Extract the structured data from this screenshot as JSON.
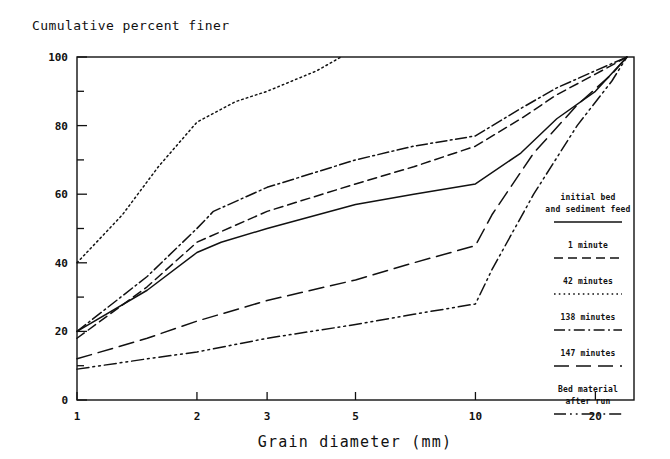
{
  "chart_data": {
    "type": "line",
    "title": "Cumulative percent finer",
    "xlabel": "Grain diameter (mm)",
    "ylabel": "Cumulative percent finer",
    "xscale": "log",
    "xlim": [
      1,
      25
    ],
    "ylim": [
      0,
      100
    ],
    "grid": false,
    "legend_position": "inside-right",
    "xticks": [
      "1",
      "2",
      "3",
      "5",
      "10",
      "20"
    ],
    "xtick_values": [
      1,
      2,
      3,
      5,
      10,
      20
    ],
    "yticks": [
      "0",
      "20",
      "40",
      "60",
      "80",
      "100"
    ],
    "ytick_values": [
      0,
      20,
      40,
      60,
      80,
      100
    ],
    "yminor_ticks": [
      10,
      30,
      50,
      70,
      90
    ],
    "series": [
      {
        "name": "Initial bed and sediment feed",
        "dash": "solid",
        "x": [
          1,
          1.5,
          2,
          2.3,
          3,
          5,
          7,
          10,
          13,
          16,
          20,
          24
        ],
        "values": [
          20,
          32,
          43,
          46,
          50,
          57,
          60,
          63,
          72,
          82,
          90,
          100
        ]
      },
      {
        "name": "1 minute",
        "dash": "dashed",
        "x": [
          1,
          1.5,
          2,
          3,
          5,
          7,
          10,
          13,
          16,
          20,
          24
        ],
        "values": [
          18,
          33,
          46,
          55,
          63,
          68,
          74,
          82,
          89,
          95,
          100
        ]
      },
      {
        "name": "42 minutes",
        "dash": "dotted",
        "x": [
          1,
          1.3,
          1.6,
          2,
          2.5,
          3,
          4,
          4.6
        ],
        "values": [
          40,
          54,
          68,
          81,
          87,
          90,
          96,
          100
        ]
      },
      {
        "name": "138 minutes",
        "dash": "dash-dot",
        "x": [
          1,
          1.5,
          2,
          2.2,
          3,
          5,
          7,
          10,
          13,
          16,
          20,
          24
        ],
        "values": [
          20,
          36,
          50,
          55,
          62,
          70,
          74,
          77,
          85,
          91,
          96,
          100
        ]
      },
      {
        "name": "147 minutes",
        "dash": "long-dash",
        "x": [
          1,
          1.5,
          2,
          3,
          5,
          7,
          10,
          11,
          14,
          18,
          22,
          24
        ],
        "values": [
          12,
          18,
          23,
          29,
          35,
          40,
          45,
          54,
          72,
          86,
          95,
          100
        ]
      },
      {
        "name": "Bed material after run",
        "dash": "dash-dot-dot",
        "x": [
          1,
          1.5,
          2,
          3,
          5,
          7,
          10,
          11,
          14,
          18,
          22,
          24
        ],
        "values": [
          9,
          12,
          14,
          18,
          22,
          25,
          28,
          38,
          60,
          80,
          93,
          100
        ]
      }
    ]
  },
  "legend": {
    "entries": [
      {
        "label_line1": "initial bed",
        "label_line2": "and sediment feed",
        "dash": "solid"
      },
      {
        "label_line1": "1 minute",
        "label_line2": "",
        "dash": "dashed"
      },
      {
        "label_line1": "42 minutes",
        "label_line2": "",
        "dash": "dotted"
      },
      {
        "label_line1": "138 minutes",
        "label_line2": "",
        "dash": "dash-dot"
      },
      {
        "label_line1": "147 minutes",
        "label_line2": "",
        "dash": "long-dash"
      },
      {
        "label_line1": "Bed material",
        "label_line2": "after run",
        "dash": "dash-dot-dot"
      }
    ]
  },
  "colors": {
    "ink": "#111111",
    "background": "#ffffff"
  }
}
